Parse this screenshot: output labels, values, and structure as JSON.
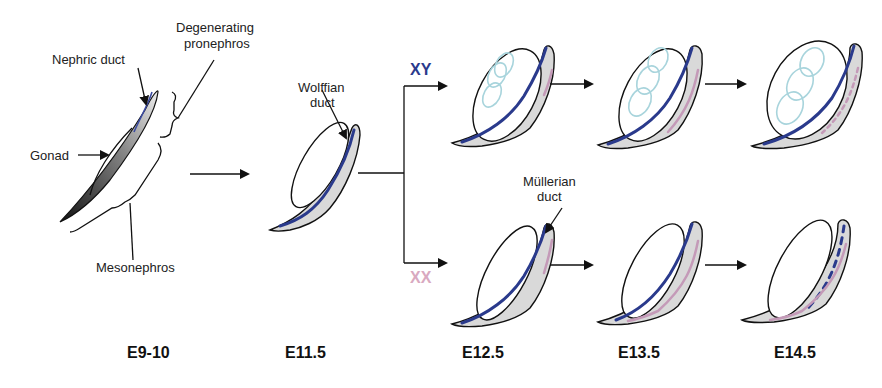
{
  "labels": {
    "nephric_duct": "Nephric duct",
    "degenerating_pronephros_1": "Degenerating",
    "degenerating_pronephros_2": "pronephros",
    "gonad": "Gonad",
    "mesonephros": "Mesonephros",
    "wolffian_duct_1": "Wolffian",
    "wolffian_duct_2": "duct",
    "mullerian_duct_1": "Müllerian",
    "mullerian_duct_2": "duct"
  },
  "sex": {
    "xy": "XY",
    "xx": "XX",
    "xy_color": "#2a3a8c",
    "xx_color": "#d9a9c0"
  },
  "stages": [
    "E9-10",
    "E11.5",
    "E12.5",
    "E13.5",
    "E14.5"
  ],
  "colors": {
    "wolffian_duct": "#2a3a8c",
    "mullerian_duct": "#c49ab8",
    "mesonephros_fill": "#d9d9d9",
    "testis_cords": "#a8d4dc"
  }
}
